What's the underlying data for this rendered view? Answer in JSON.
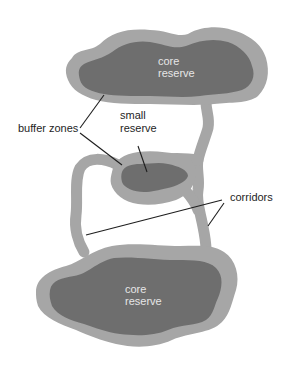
{
  "colors": {
    "core": "#6e6e6e",
    "buffer": "#a6a6a6",
    "leader_line": "#1e1e1e",
    "background": "#ffffff"
  },
  "labels": {
    "top_core": [
      "core",
      "reserve"
    ],
    "bottom_core": [
      "core",
      "reserve"
    ],
    "small_reserve": [
      "small",
      "reserve"
    ],
    "buffer_zones": "buffer zones",
    "corridors": "corridors"
  }
}
